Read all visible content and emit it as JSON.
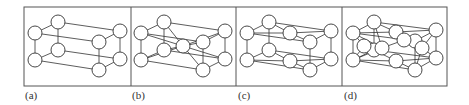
{
  "figure": {
    "frame": {
      "x": 24,
      "y": 7,
      "width": 423,
      "height": 79,
      "stroke": "#555555"
    },
    "atom_radius": 7,
    "line_color": "#333333",
    "panels": [
      {
        "id": "a",
        "label": "(a)",
        "label_x": 25,
        "divider_x": 131,
        "atoms": [
          [
            35,
            33
          ],
          [
            58,
            22
          ],
          [
            35,
            60
          ],
          [
            58,
            50
          ],
          [
            99,
            42
          ],
          [
            120,
            31
          ],
          [
            99,
            70
          ],
          [
            120,
            59
          ]
        ],
        "bonds": [
          [
            0,
            1
          ],
          [
            2,
            3
          ],
          [
            0,
            2
          ],
          [
            1,
            3
          ],
          [
            4,
            5
          ],
          [
            6,
            7
          ],
          [
            4,
            6
          ],
          [
            5,
            7
          ],
          [
            0,
            4
          ],
          [
            1,
            5
          ],
          [
            2,
            6
          ],
          [
            3,
            7
          ]
        ]
      },
      {
        "id": "b",
        "label": "(b)",
        "label_x": 132,
        "divider_x": 236,
        "atoms": [
          [
            141,
            33
          ],
          [
            164,
            22
          ],
          [
            141,
            60
          ],
          [
            164,
            50
          ],
          [
            203,
            42
          ],
          [
            225,
            31
          ],
          [
            203,
            70
          ],
          [
            225,
            59
          ],
          [
            183,
            46
          ]
        ],
        "bonds": [
          [
            0,
            1
          ],
          [
            2,
            3
          ],
          [
            0,
            2
          ],
          [
            1,
            3
          ],
          [
            4,
            5
          ],
          [
            6,
            7
          ],
          [
            4,
            6
          ],
          [
            5,
            7
          ],
          [
            0,
            4
          ],
          [
            1,
            5
          ],
          [
            2,
            6
          ],
          [
            3,
            7
          ],
          [
            8,
            0
          ],
          [
            8,
            1
          ],
          [
            8,
            2
          ],
          [
            8,
            3
          ],
          [
            8,
            4
          ],
          [
            8,
            5
          ],
          [
            8,
            6
          ],
          [
            8,
            7
          ]
        ]
      },
      {
        "id": "c",
        "label": "(c)",
        "label_x": 238,
        "divider_x": 342,
        "atoms": [
          [
            247,
            33
          ],
          [
            269,
            22
          ],
          [
            247,
            60
          ],
          [
            269,
            50
          ],
          [
            310,
            42
          ],
          [
            331,
            31
          ],
          [
            310,
            70
          ],
          [
            331,
            59
          ],
          [
            290,
            33
          ],
          [
            290,
            61
          ]
        ],
        "bonds": [
          [
            0,
            1
          ],
          [
            2,
            3
          ],
          [
            0,
            2
          ],
          [
            1,
            3
          ],
          [
            4,
            5
          ],
          [
            6,
            7
          ],
          [
            4,
            6
          ],
          [
            5,
            7
          ],
          [
            0,
            4
          ],
          [
            1,
            5
          ],
          [
            2,
            6
          ],
          [
            3,
            7
          ],
          [
            8,
            0
          ],
          [
            8,
            1
          ],
          [
            8,
            4
          ],
          [
            8,
            5
          ],
          [
            9,
            2
          ],
          [
            9,
            3
          ],
          [
            9,
            6
          ],
          [
            9,
            7
          ]
        ]
      },
      {
        "id": "d",
        "label": "(d)",
        "label_x": 344,
        "divider_x": null,
        "atoms": [
          [
            353,
            33
          ],
          [
            374,
            22
          ],
          [
            353,
            60
          ],
          [
            374,
            50
          ],
          [
            415,
            41
          ],
          [
            436,
            30
          ],
          [
            415,
            70
          ],
          [
            436,
            58
          ],
          [
            396,
            32
          ],
          [
            396,
            61
          ],
          [
            382,
            48
          ],
          [
            404,
            40
          ],
          [
            422,
            48
          ],
          [
            364,
            46
          ]
        ],
        "bonds": [
          [
            0,
            1
          ],
          [
            2,
            3
          ],
          [
            0,
            2
          ],
          [
            1,
            3
          ],
          [
            4,
            5
          ],
          [
            6,
            7
          ],
          [
            4,
            6
          ],
          [
            5,
            7
          ],
          [
            0,
            4
          ],
          [
            1,
            5
          ],
          [
            2,
            6
          ],
          [
            3,
            7
          ],
          [
            8,
            0
          ],
          [
            8,
            1
          ],
          [
            8,
            4
          ],
          [
            8,
            5
          ],
          [
            9,
            2
          ],
          [
            9,
            3
          ],
          [
            9,
            6
          ],
          [
            9,
            7
          ],
          [
            10,
            0
          ],
          [
            10,
            1
          ],
          [
            10,
            2
          ],
          [
            10,
            3
          ],
          [
            11,
            8
          ],
          [
            11,
            4
          ],
          [
            12,
            4
          ],
          [
            12,
            5
          ],
          [
            12,
            6
          ],
          [
            12,
            7
          ],
          [
            13,
            0
          ],
          [
            13,
            2
          ],
          [
            10,
            11
          ]
        ]
      }
    ]
  }
}
